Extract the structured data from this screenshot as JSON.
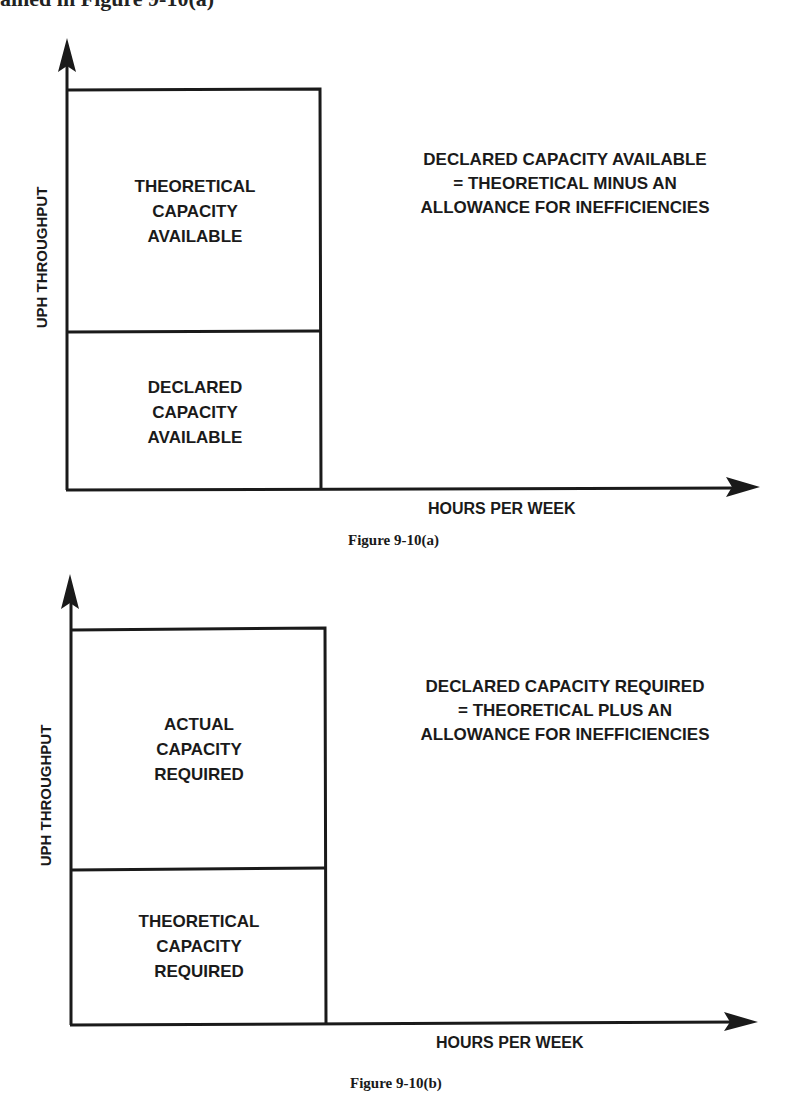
{
  "header_fragment": "ained in Figure 9-10(a)",
  "figures": [
    {
      "caption": "Figure 9-10(a)",
      "y_axis_label": "UPH THROUGHPUT",
      "x_axis_label": "HOURS PER WEEK",
      "upper_box": [
        "THEORETICAL",
        "CAPACITY",
        "AVAILABLE"
      ],
      "lower_box": [
        "DECLARED",
        "CAPACITY",
        "AVAILABLE"
      ],
      "note": [
        "DECLARED CAPACITY AVAILABLE",
        "= THEORETICAL MINUS AN",
        "ALLOWANCE FOR INEFFICIENCIES"
      ]
    },
    {
      "caption": "Figure 9-10(b)",
      "y_axis_label": "UPH THROUGHPUT",
      "x_axis_label": "HOURS PER WEEK",
      "upper_box": [
        "ACTUAL",
        "CAPACITY",
        "REQUIRED"
      ],
      "lower_box": [
        "THEORETICAL",
        "CAPACITY",
        "REQUIRED"
      ],
      "note": [
        "DECLARED CAPACITY REQUIRED",
        "= THEORETICAL PLUS AN",
        "ALLOWANCE FOR INEFFICIENCIES"
      ]
    }
  ],
  "colors": {
    "ink": "#1a1a1a",
    "background": "#ffffff"
  }
}
